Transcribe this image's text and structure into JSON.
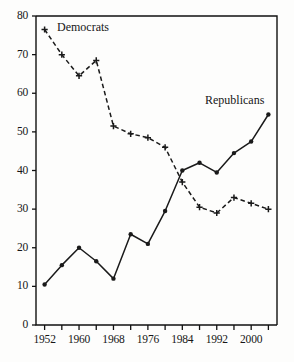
{
  "chart_data": {
    "type": "line",
    "title": "",
    "xlabel": "",
    "ylabel": "",
    "xlim": [
      1950,
      2006
    ],
    "ylim": [
      0,
      80
    ],
    "grid": false,
    "legend_position": "inline-annotations",
    "x": [
      1952,
      1956,
      1960,
      1964,
      1968,
      1972,
      1976,
      1980,
      1984,
      1988,
      1992,
      1996,
      2000,
      2004
    ],
    "y_ticks": [
      0,
      10,
      20,
      30,
      40,
      50,
      60,
      70,
      80
    ],
    "y_tick_labels": [
      "0",
      "10",
      "20",
      "30",
      "40",
      "50",
      "60",
      "70",
      "80"
    ],
    "x_ticks": [
      1952,
      1956,
      1960,
      1964,
      1968,
      1972,
      1976,
      1980,
      1984,
      1988,
      1992,
      1996,
      2000,
      2004
    ],
    "x_tick_labels": [
      "1952",
      "",
      "1960",
      "",
      "1968",
      "",
      "1976",
      "",
      "1984",
      "",
      "1992",
      "",
      "2000",
      ""
    ],
    "series": [
      {
        "name": "Democrats",
        "style": "dashed",
        "marker": "plus",
        "color": "#1a1a1a",
        "values": [
          76.5,
          70.0,
          64.5,
          68.5,
          51.5,
          49.5,
          48.5,
          46.0,
          37.0,
          30.5,
          29.0,
          33.0,
          31.5,
          30.0
        ]
      },
      {
        "name": "Republicans",
        "style": "solid",
        "marker": "dot",
        "color": "#1a1a1a",
        "values": [
          10.5,
          15.5,
          20.0,
          16.5,
          12.0,
          23.5,
          21.0,
          29.5,
          40.0,
          42.0,
          39.5,
          44.5,
          47.5,
          54.5
        ]
      }
    ],
    "annotations": [
      {
        "text": "Democrats",
        "x_px": 57,
        "y_px": 20
      },
      {
        "text": "Republicans",
        "x_px": 205,
        "y_px": 93
      }
    ]
  },
  "axes": {
    "y_tick_labels": [
      "80",
      "70",
      "60",
      "50",
      "40",
      "30",
      "20",
      "10",
      "0"
    ],
    "x_tick_labels": [
      "1952",
      "1960",
      "1968",
      "1976",
      "1984",
      "1992",
      "2000"
    ]
  }
}
